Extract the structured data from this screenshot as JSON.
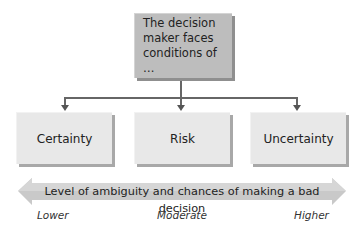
{
  "diagram": {
    "top_box": {
      "text": "The decision maker faces conditions of …"
    },
    "choices": [
      {
        "label": "Certainty"
      },
      {
        "label": "Risk"
      },
      {
        "label": "Uncertainty"
      }
    ],
    "scale": {
      "label": "Level of ambiguity and chances of making a bad decision",
      "ticks": [
        "Lower",
        "Moderate",
        "Higher"
      ]
    },
    "colors": {
      "top_box": "#bdbdbd",
      "choice_box": "#e8e8e8",
      "connector": "#666666",
      "band": "#c8c8c8"
    }
  }
}
